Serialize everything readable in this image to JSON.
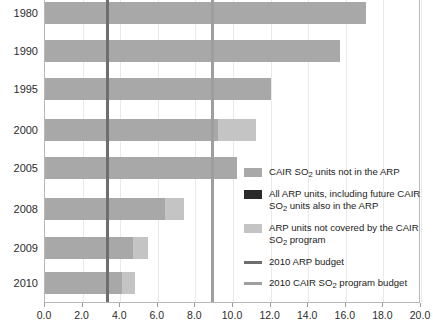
{
  "chart_data": {
    "type": "bar",
    "orientation": "horizontal",
    "title": "",
    "xlabel": "",
    "ylabel": "",
    "xlim": [
      0.0,
      20.0
    ],
    "xticks": [
      "0.0",
      "2.0",
      "4.0",
      "6.0",
      "8.0",
      "10.0",
      "12.0",
      "14.0",
      "16.0",
      "18.0",
      "20.0"
    ],
    "grid": true,
    "legend_position": "right",
    "categories": [
      "1980",
      "1990",
      "1995",
      "2000",
      "2005",
      "2008",
      "2009",
      "2010"
    ],
    "series": [
      {
        "name": "All ARP units, including future CAIR SO2 units also in the ARP",
        "color": "#a8a8a8",
        "values": [
          17.1,
          15.7,
          12.0,
          9.2,
          10.2,
          6.4,
          4.7,
          4.1
        ]
      },
      {
        "name": "ARP units not covered by the CAIR SO2 program",
        "color": "#c4c4c4",
        "values": [
          0.0,
          0.0,
          0.0,
          2.0,
          0.0,
          1.0,
          0.8,
          0.7
        ]
      }
    ],
    "totals": [
      17.1,
      15.7,
      12.0,
      11.2,
      10.2,
      7.4,
      5.5,
      4.8
    ],
    "reference_lines": [
      {
        "name": "2010 ARP budget",
        "value": 3.3,
        "color": "#6e6e6e"
      },
      {
        "name": "2010 CAIR SO2 program budget",
        "value": 8.9,
        "color": "#9e9e9e"
      }
    ]
  },
  "axes": {
    "y_tick_labels": [
      "1980",
      "1990",
      "1995",
      "2000",
      "2005",
      "2008",
      "2009",
      "2010"
    ],
    "x_tick_labels": [
      "0.0",
      "2.0",
      "4.0",
      "6.0",
      "8.0",
      "10.0",
      "12.0",
      "14.0",
      "16.0",
      "18.0",
      "20.0"
    ]
  },
  "legend": {
    "items": [
      {
        "swatch_kind": "box",
        "color": "#a8a8a8",
        "line1_pre": "CAIR SO",
        "line1_sub": "2",
        "line1_post": " units not in the ARP",
        "line2_pre": "",
        "line2_sub": "",
        "line2_post": ""
      },
      {
        "swatch_kind": "box",
        "color": "#2a2a2a",
        "line1_pre": "All ARP units, including future CAIR",
        "line1_sub": "",
        "line1_post": "",
        "line2_pre": "SO",
        "line2_sub": "2",
        "line2_post": " units also in the ARP"
      },
      {
        "swatch_kind": "box",
        "color": "#c4c4c4",
        "line1_pre": "ARP units not covered by the CAIR",
        "line1_sub": "",
        "line1_post": "",
        "line2_pre": "SO",
        "line2_sub": "2",
        "line2_post": " program"
      },
      {
        "swatch_kind": "line",
        "color": "#6e6e6e",
        "line1_pre": "2010 ARP budget",
        "line1_sub": "",
        "line1_post": "",
        "line2_pre": "",
        "line2_sub": "",
        "line2_post": ""
      },
      {
        "swatch_kind": "line",
        "color": "#9e9e9e",
        "line1_pre": "2010 CAIR SO",
        "line1_sub": "2",
        "line1_post": " program budget",
        "line2_pre": "",
        "line2_sub": "",
        "line2_post": ""
      }
    ]
  },
  "colors": {
    "bar_primary": "#a8a8a8",
    "bar_secondary": "#c4c4c4",
    "bar_dark": "#2a2a2a",
    "ref_dark": "#6e6e6e",
    "ref_light": "#9e9e9e",
    "grid": "#e9e9e9",
    "axis": "#b8b8b8",
    "text": "#1c1c1c"
  }
}
